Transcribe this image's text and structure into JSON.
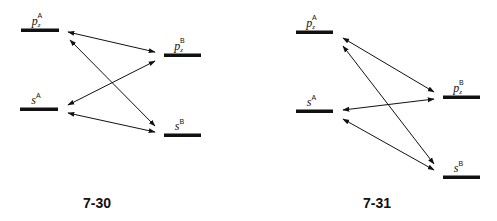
{
  "figures": [
    {
      "id": "7-30",
      "caption": "7-30",
      "levels": [
        {
          "name": "pz-A",
          "base": "p",
          "sub": "z",
          "sup": "A",
          "x1": 21,
          "x2": 59,
          "y": 30
        },
        {
          "name": "s-A",
          "base": "s",
          "sub": "",
          "sup": "A",
          "x1": 20,
          "x2": 58,
          "y": 109
        },
        {
          "name": "pz-B",
          "base": "p",
          "sub": "z",
          "sup": "B",
          "x1": 164,
          "x2": 201,
          "y": 55
        },
        {
          "name": "s-B",
          "base": "s",
          "sub": "",
          "sup": "B",
          "x1": 164,
          "x2": 201,
          "y": 135
        }
      ],
      "arrows": [
        {
          "from": "pz-A",
          "to": "pz-B",
          "x1": 68,
          "y1": 32,
          "x2": 155,
          "y2": 52
        },
        {
          "from": "pz-A",
          "to": "s-B",
          "x1": 70,
          "y1": 40,
          "x2": 155,
          "y2": 126
        },
        {
          "from": "s-A",
          "to": "pz-B",
          "x1": 68,
          "y1": 105,
          "x2": 155,
          "y2": 61
        },
        {
          "from": "s-A",
          "to": "s-B",
          "x1": 68,
          "y1": 113,
          "x2": 155,
          "y2": 132
        }
      ]
    },
    {
      "id": "7-31",
      "caption": "7-31",
      "levels": [
        {
          "name": "pz-A",
          "base": "p",
          "sub": "z",
          "sup": "A",
          "x1": 296,
          "x2": 333,
          "y": 32
        },
        {
          "name": "s-A",
          "base": "s",
          "sub": "",
          "sup": "A",
          "x1": 296,
          "x2": 333,
          "y": 111
        },
        {
          "name": "pz-B",
          "base": "p",
          "sub": "z",
          "sup": "B",
          "x1": 443,
          "x2": 480,
          "y": 97
        },
        {
          "name": "s-B",
          "base": "s",
          "sub": "",
          "sup": "B",
          "x1": 443,
          "x2": 480,
          "y": 177
        }
      ],
      "arrows": [
        {
          "from": "pz-A",
          "to": "pz-B",
          "x1": 343,
          "y1": 38,
          "x2": 434,
          "y2": 92
        },
        {
          "from": "pz-A",
          "to": "s-B",
          "x1": 343,
          "y1": 46,
          "x2": 434,
          "y2": 164
        },
        {
          "from": "s-A",
          "to": "pz-B",
          "x1": 343,
          "y1": 110,
          "x2": 434,
          "y2": 99
        },
        {
          "from": "s-A",
          "to": "s-B",
          "x1": 343,
          "y1": 119,
          "x2": 434,
          "y2": 170
        }
      ]
    }
  ],
  "colors": {
    "line": "#111111",
    "background": "#ffffff"
  }
}
